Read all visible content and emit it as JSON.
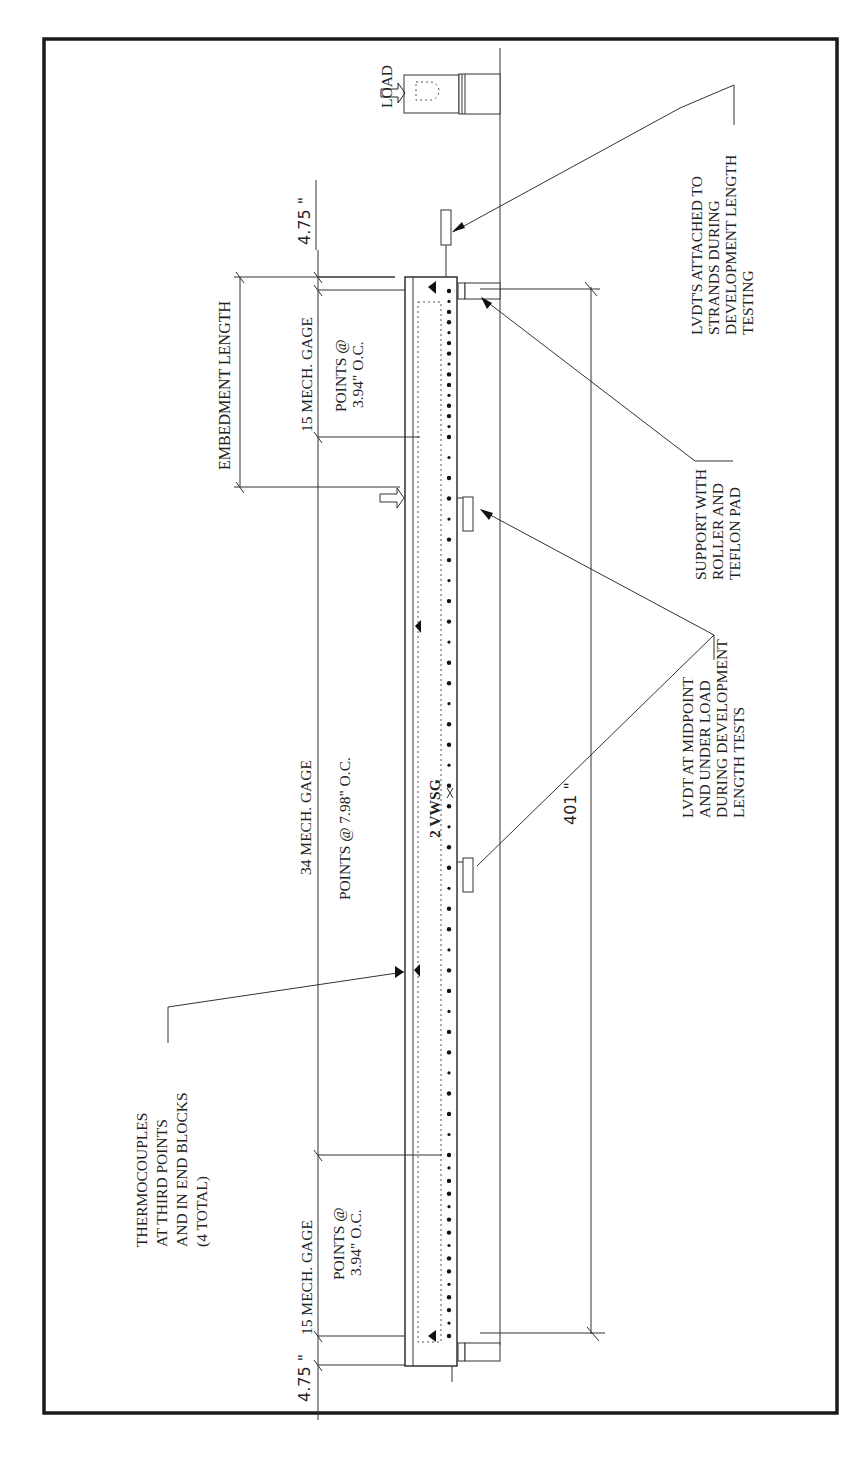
{
  "diagram": {
    "type": "beam test instrumentation layout",
    "orientation": "rotated 90° counter-clockwise",
    "labels": {
      "load": "LOAD",
      "lvdt_strands": [
        "LVDT'S ATTACHED TO",
        "STRANDS DURING",
        "DEVELOPMENT LENGTH",
        "TESTING"
      ],
      "support": [
        "SUPPORT WITH",
        "ROLLER AND",
        "TEFLON PAD"
      ],
      "lvdt_midpoint": [
        "LVDT AT MIDPOINT",
        "AND UNDER LOAD",
        "DURING DEVELOPMENT",
        "LENGTH TESTS"
      ],
      "thermocouples": [
        "THERMOCOUPLES",
        "AT THIRD POINTS",
        "AND IN END BLOCKS",
        "(4 TOTAL)"
      ],
      "embedment_length": "EMBEDMENT LENGTH",
      "gage_top_count": "15 MECH. GAGE",
      "gage_top_spacing": [
        "POINTS @",
        "3.94\" O.C."
      ],
      "gage_mid_count": "34 MECH. GAGE",
      "gage_mid_spacing": "POINTS @ 7.98\" O.C.",
      "gage_bot_count": "15 MECH. GAGE",
      "gage_bot_spacing": [
        "POINTS @",
        "3.94\" O.C."
      ],
      "vwsg": "2 VWSG"
    },
    "dimensions": {
      "end_top": "4.75 \"",
      "end_bottom": "4.75 \"",
      "span": "401 \""
    },
    "counts": {
      "mech_gage_end_zone_points": 15,
      "mech_gage_middle_points": 34,
      "vwsg": 2,
      "thermocouples": 4
    },
    "colors": {
      "ink": "#222222",
      "background": "#ffffff"
    }
  }
}
